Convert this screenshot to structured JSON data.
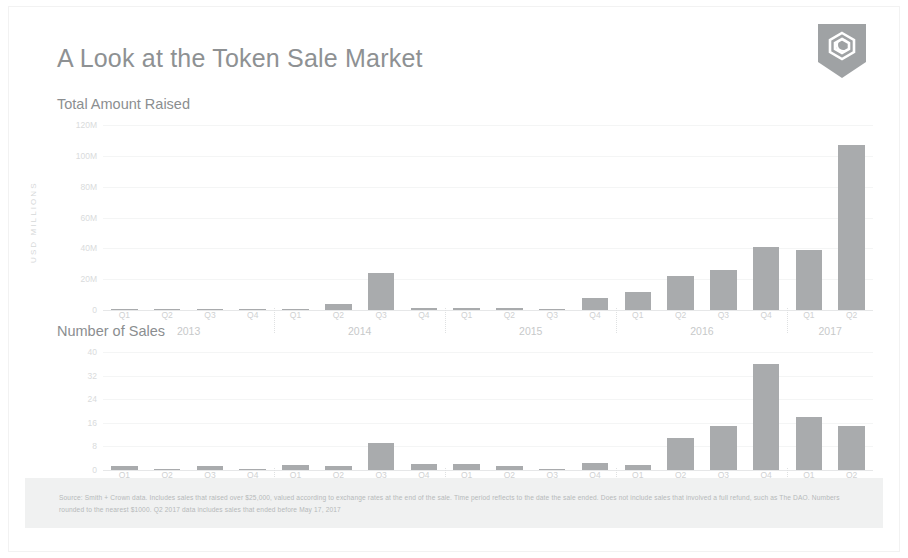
{
  "header": {
    "title": "A Look at the Token Sale Market",
    "logo_name": "smith-crown-shield-logo"
  },
  "sections": {
    "amount_label": "Total Amount Raised",
    "sales_label": "Number of Sales"
  },
  "footnote": {
    "text": "Source: Smith + Crown data. Includes sales that raised over $25,000, valued according to exchange rates at the end of the sale. Time period reflects to the date the sale ended. Does not include sales that involved a full refund, such as The DAO. Numbers rounded to the nearest $1000. Q2 2017 data includes sales that ended before May 17, 2017"
  },
  "colors": {
    "bar": "#a9abad",
    "title": "#8e9193",
    "grid": "#f4f5f5",
    "footnote_band": "#f0f1f1"
  },
  "chart_data": [
    {
      "type": "bar",
      "title": "Total Amount Raised",
      "ylabel": "USD MILLIONS",
      "xlabel": "",
      "ylim": [
        0,
        120
      ],
      "yticks": [
        0,
        20,
        40,
        60,
        80,
        100,
        120
      ],
      "ytick_labels": [
        "0",
        "20M",
        "40M",
        "60M",
        "80M",
        "100M",
        "120M"
      ],
      "grid": true,
      "legend": "none",
      "categories": [
        "Q1",
        "Q2",
        "Q3",
        "Q4",
        "Q1",
        "Q2",
        "Q3",
        "Q4",
        "Q1",
        "Q2",
        "Q3",
        "Q4",
        "Q1",
        "Q2",
        "Q3",
        "Q4",
        "Q1",
        "Q2"
      ],
      "year_groups": [
        {
          "year": "2013",
          "quarters": [
            "Q1",
            "Q2",
            "Q3",
            "Q4"
          ]
        },
        {
          "year": "2014",
          "quarters": [
            "Q1",
            "Q2",
            "Q3",
            "Q4"
          ]
        },
        {
          "year": "2015",
          "quarters": [
            "Q1",
            "Q2",
            "Q3",
            "Q4"
          ]
        },
        {
          "year": "2016",
          "quarters": [
            "Q1",
            "Q2",
            "Q3",
            "Q4"
          ]
        },
        {
          "year": "2017",
          "quarters": [
            "Q1",
            "Q2"
          ]
        }
      ],
      "values": [
        0.3,
        0.4,
        0.6,
        0.8,
        0.7,
        4.0,
        24.0,
        1.2,
        1.5,
        1.3,
        0.9,
        8.0,
        12.0,
        22.0,
        26.0,
        41.0,
        39.0,
        107.0
      ]
    },
    {
      "type": "bar",
      "title": "Number of Sales",
      "ylabel": "",
      "xlabel": "",
      "ylim": [
        0,
        40
      ],
      "yticks": [
        0,
        8,
        16,
        24,
        32,
        40
      ],
      "ytick_labels": [
        "0",
        "8",
        "16",
        "24",
        "32",
        "40"
      ],
      "grid": true,
      "legend": "none",
      "categories": [
        "Q1",
        "Q2",
        "Q3",
        "Q4",
        "Q1",
        "Q2",
        "Q3",
        "Q4",
        "Q1",
        "Q2",
        "Q3",
        "Q4",
        "Q1",
        "Q2",
        "Q3",
        "Q4",
        "Q1",
        "Q2"
      ],
      "year_groups": [
        {
          "year": "2013",
          "quarters": [
            "Q1",
            "Q2",
            "Q3",
            "Q4"
          ]
        },
        {
          "year": "2014",
          "quarters": [
            "Q1",
            "Q2",
            "Q3",
            "Q4"
          ]
        },
        {
          "year": "2015",
          "quarters": [
            "Q1",
            "Q2",
            "Q3",
            "Q4"
          ]
        },
        {
          "year": "2016",
          "quarters": [
            "Q1",
            "Q2",
            "Q3",
            "Q4"
          ]
        },
        {
          "year": "2017",
          "quarters": [
            "Q1",
            "Q2"
          ]
        }
      ],
      "values": [
        1.5,
        0.4,
        1.2,
        0.3,
        1.8,
        1.2,
        9.0,
        2.0,
        2.0,
        1.5,
        0.4,
        2.5,
        1.8,
        11.0,
        15.0,
        36.0,
        18.0,
        15.0
      ]
    }
  ]
}
